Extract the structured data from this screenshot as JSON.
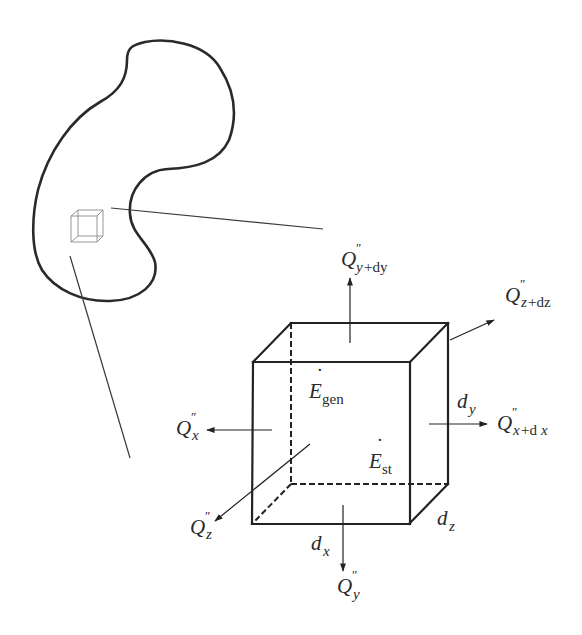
{
  "figure": {
    "colors": {
      "ink": "#222222",
      "small_cube": "#8a8a8a",
      "background": "#ffffff"
    }
  },
  "labels": {
    "q_x": {
      "base": "Q",
      "prime": "″",
      "sub": "x",
      "sub_rest": ""
    },
    "q_x_dx": {
      "base": "Q",
      "prime": "″",
      "sub": "x",
      "sub_rest": "+d",
      "sub_tail": "x"
    },
    "q_y": {
      "base": "Q",
      "prime": "″",
      "sub": "y",
      "sub_rest": ""
    },
    "q_y_dy": {
      "base": "Q",
      "prime": "″",
      "sub": "y",
      "sub_rest": "+dy"
    },
    "q_z": {
      "base": "Q",
      "prime": "″",
      "sub": "z",
      "sub_rest": ""
    },
    "q_z_dz": {
      "base": "Q",
      "prime": "″",
      "sub": "z",
      "sub_rest": "+dz"
    },
    "e_gen": {
      "base": "E",
      "dot": "˙",
      "sub": "gen"
    },
    "e_st": {
      "base": "E",
      "dot": "˙",
      "sub": "st"
    },
    "d_x": {
      "base": "d",
      "sub": "x"
    },
    "d_y": {
      "base": "d",
      "sub": "y"
    },
    "d_z": {
      "base": "d",
      "sub": "z"
    }
  }
}
